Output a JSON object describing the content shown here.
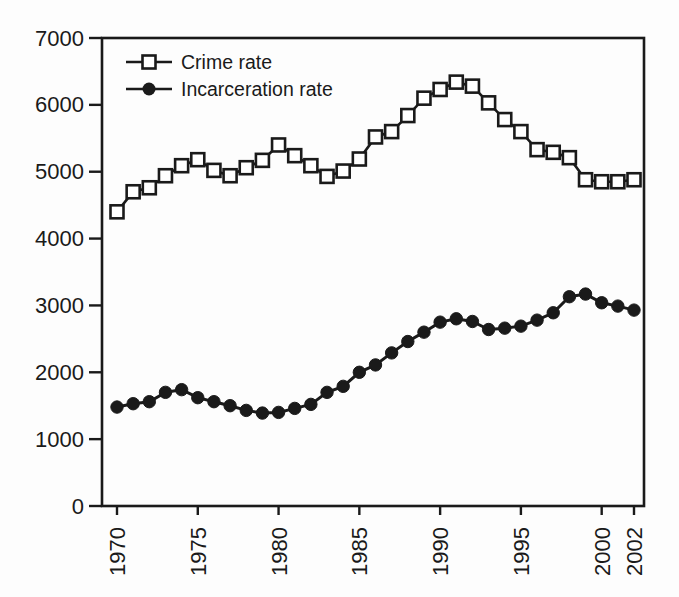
{
  "figure": {
    "background": "#fdfdfd",
    "ink_color": "#1a1a1a"
  },
  "chart_data": {
    "type": "line",
    "title": "",
    "xlabel": "",
    "ylabel": "",
    "x": [
      1970,
      1971,
      1972,
      1973,
      1974,
      1975,
      1976,
      1977,
      1978,
      1979,
      1980,
      1981,
      1982,
      1983,
      1984,
      1985,
      1986,
      1987,
      1988,
      1989,
      1990,
      1991,
      1992,
      1993,
      1994,
      1995,
      1996,
      1997,
      1998,
      1999,
      2000,
      2001,
      2002
    ],
    "series": [
      {
        "name": "Crime rate",
        "marker": "open-square",
        "color": "#1a1a1a",
        "values": [
          4400,
          4700,
          4760,
          4940,
          5090,
          5180,
          5020,
          4940,
          5060,
          5170,
          5400,
          5240,
          5090,
          4930,
          5010,
          5190,
          5520,
          5600,
          5840,
          6100,
          6230,
          6340,
          6280,
          6030,
          5780,
          5600,
          5330,
          5290,
          5210,
          4880,
          4850,
          4850,
          4880
        ]
      },
      {
        "name": "Incarceration rate",
        "marker": "filled-circle",
        "color": "#1a1a1a",
        "values": [
          1480,
          1530,
          1560,
          1700,
          1740,
          1620,
          1560,
          1500,
          1430,
          1390,
          1400,
          1460,
          1520,
          1700,
          1790,
          2000,
          2110,
          2290,
          2460,
          2600,
          2750,
          2800,
          2760,
          2640,
          2660,
          2690,
          2780,
          2890,
          3130,
          3170,
          3040,
          2990,
          2930
        ]
      }
    ],
    "xticks": [
      1970,
      1975,
      1980,
      1985,
      1990,
      1995,
      2000,
      2002
    ],
    "yticks": [
      0,
      1000,
      2000,
      3000,
      4000,
      5000,
      6000,
      7000
    ],
    "xlim": [
      1969.1,
      2002.6
    ],
    "ylim": [
      0,
      7000
    ],
    "grid": false,
    "legend_position": "inside-top-left",
    "x_tick_label_rotation": -90
  }
}
